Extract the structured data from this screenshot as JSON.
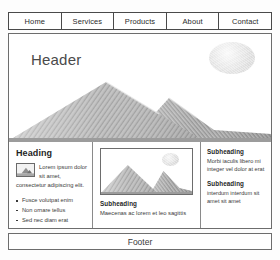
{
  "nav": {
    "items": [
      {
        "label": "Home"
      },
      {
        "label": "Services"
      },
      {
        "label": "Products"
      },
      {
        "label": "About"
      },
      {
        "label": "Contact"
      }
    ]
  },
  "hero": {
    "title": "Header",
    "sun_icon": "sun-icon",
    "mountain_icon": "mountain-range-illustration"
  },
  "left_column": {
    "heading": "Heading",
    "thumb_icon": "image-thumbnail-icon",
    "body": "Lorem ipsum dolor sit amet, consectetur adipiscing elit.",
    "bullets": [
      {
        "label": "Fusce volutpat enim"
      },
      {
        "label": "Non ornare tellus"
      },
      {
        "label": "Sed nec diam erat"
      }
    ]
  },
  "mid_column": {
    "card_sun_icon": "sun-icon",
    "card_mountain_icon": "mountain-illustration",
    "subheading": "Subheading",
    "caption": "Maecenas ac lorem et leo sagittis"
  },
  "right_column": {
    "blocks": [
      {
        "subheading": "Subheading",
        "text": "Morbi iaculis libero mi integer vel dolor at erat"
      },
      {
        "subheading": "Subheading",
        "text": "interdum interdum sit amet sit amet"
      }
    ]
  },
  "footer": {
    "label": "Footer"
  },
  "colors": {
    "border": "#6d6d6d",
    "nav_border": "#4a4a4a",
    "text": "#2b2b2b",
    "muted": "#3a3a3a",
    "hero_title": "#4a4a4a"
  }
}
